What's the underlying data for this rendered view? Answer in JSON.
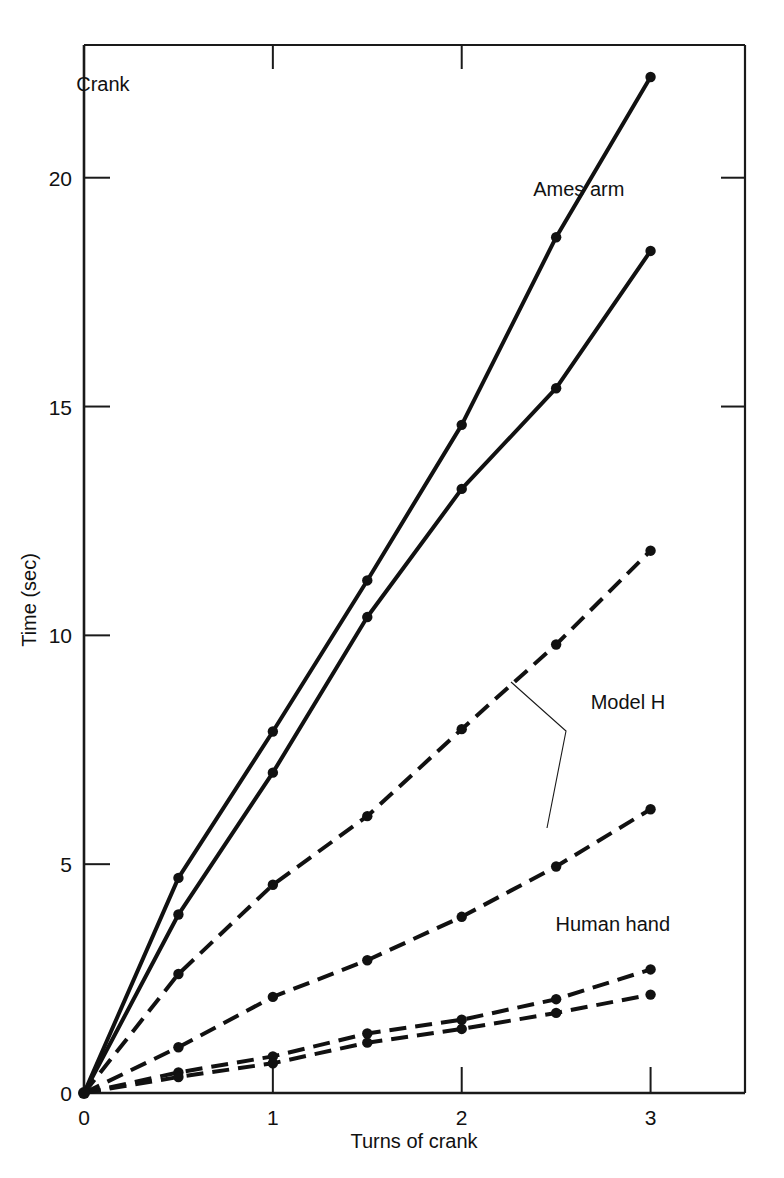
{
  "chart_data": {
    "type": "line",
    "title": "",
    "corner_label": "Crank",
    "xlabel": "Turns of crank",
    "ylabel": "Time (sec)",
    "xlim": [
      0,
      3.5
    ],
    "ylim": [
      0,
      22.9
    ],
    "xticks": [
      0,
      1,
      2,
      3
    ],
    "xticklabels": [
      "0",
      "1",
      "2",
      "3"
    ],
    "yticks": [
      0,
      5,
      10,
      15,
      20
    ],
    "yticklabels": [
      "0",
      "5",
      "10",
      "15",
      "20"
    ],
    "grid": false,
    "legend": "annotations-on-plot",
    "x": [
      0,
      0.5,
      1,
      1.5,
      2,
      2.5,
      3
    ],
    "series": [
      {
        "name": "Ames arm (upper)",
        "group": "Ames arm",
        "style": "solid",
        "values": [
          0,
          4.7,
          7.9,
          11.2,
          14.6,
          18.7,
          22.2
        ]
      },
      {
        "name": "Ames arm (lower)",
        "group": "Ames arm",
        "style": "solid",
        "values": [
          0,
          3.9,
          7.0,
          10.4,
          13.2,
          15.4,
          18.4
        ]
      },
      {
        "name": "Model H (upper)",
        "group": "Model H",
        "style": "dashed",
        "values": [
          0,
          2.6,
          4.55,
          6.05,
          7.95,
          9.8,
          11.85
        ]
      },
      {
        "name": "Model H (lower)",
        "group": "Model H",
        "style": "dashed",
        "values": [
          0,
          1.0,
          2.1,
          2.9,
          3.85,
          4.95,
          6.2
        ]
      },
      {
        "name": "Human hand (upper)",
        "group": "Human hand",
        "style": "dashed",
        "values": [
          0,
          0.45,
          0.8,
          1.3,
          1.6,
          2.05,
          2.7
        ]
      },
      {
        "name": "Human hand (lower)",
        "group": "Human hand",
        "style": "dashed",
        "values": [
          0,
          0.35,
          0.65,
          1.1,
          1.4,
          1.75,
          2.15
        ]
      }
    ],
    "annotations": [
      {
        "text": "Ames arm",
        "x": 2.62,
        "y": 19.6
      },
      {
        "text": "Model H",
        "x": 2.88,
        "y": 8.4
      },
      {
        "text": "Human hand",
        "x": 2.8,
        "y": 3.55
      },
      {
        "text": "Crank",
        "x": 0.1,
        "y": 21.9
      }
    ],
    "colors": {
      "line": "#111111",
      "axis": "#1a1a1a",
      "background": "#ffffff"
    }
  }
}
